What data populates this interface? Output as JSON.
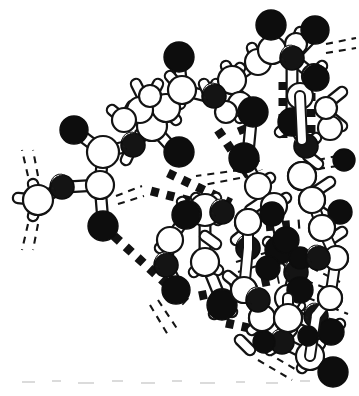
{
  "figure": {
    "background_color": "#ffffff",
    "ink_color": "#111111",
    "width_px": 359,
    "height_px": 396,
    "caption": "",
    "axis_labels": [],
    "annotations": []
  },
  "legend": {
    "atom_types": [
      {
        "name": "carbon",
        "label": "C",
        "render": "white-sphere",
        "fill": "#ffffff",
        "stroke": "#111111"
      },
      {
        "name": "nitrogen",
        "label": "N",
        "render": "stippled-sphere",
        "fill": "#1a1a1a",
        "highlight": "#e8e8e8"
      },
      {
        "name": "oxygen",
        "label": "O",
        "render": "black-sphere",
        "fill": "#0d0d0d",
        "stroke": "#0d0d0d"
      }
    ],
    "bond_types": [
      {
        "name": "covalent-bond",
        "render": "solid-cylinder",
        "color": "#ffffff",
        "outline": "#111111"
      },
      {
        "name": "hydrogen-bond",
        "render": "thick-square-dashed-line",
        "color": "#111111"
      },
      {
        "name": "truncated-bond",
        "render": "thin-dashed-line",
        "color": "#111111"
      }
    ]
  },
  "chart_data": {
    "type": "diagram",
    "atoms": [
      {
        "id": "o1",
        "element": "O",
        "x": 74,
        "y": 130,
        "r": 13
      },
      {
        "id": "c1",
        "element": "C",
        "x": 103,
        "y": 152,
        "r": 15
      },
      {
        "id": "n1",
        "element": "N",
        "x": 133,
        "y": 145,
        "r": 13
      },
      {
        "id": "c2",
        "element": "C",
        "x": 100,
        "y": 185,
        "r": 13
      },
      {
        "id": "n2",
        "element": "N",
        "x": 62,
        "y": 187,
        "r": 12
      },
      {
        "id": "c3",
        "element": "C",
        "x": 38,
        "y": 200,
        "r": 14
      },
      {
        "id": "o2",
        "element": "O",
        "x": 103,
        "y": 226,
        "r": 14
      },
      {
        "id": "c4",
        "element": "C",
        "x": 148,
        "y": 125,
        "r": 14
      },
      {
        "id": "c5",
        "element": "C",
        "x": 162,
        "y": 105,
        "r": 13
      },
      {
        "id": "c6",
        "element": "C",
        "x": 179,
        "y": 88,
        "r": 12
      },
      {
        "id": "o3",
        "element": "O",
        "x": 179,
        "y": 57,
        "r": 14
      },
      {
        "id": "c7",
        "element": "C",
        "x": 190,
        "y": 82,
        "r": 14
      },
      {
        "id": "n3",
        "element": "N",
        "x": 214,
        "y": 96,
        "r": 12
      },
      {
        "id": "o4",
        "element": "O",
        "x": 179,
        "y": 152,
        "r": 14
      },
      {
        "id": "c8",
        "element": "C",
        "x": 205,
        "y": 210,
        "r": 15
      },
      {
        "id": "n4",
        "element": "N",
        "x": 222,
        "y": 212,
        "r": 12
      },
      {
        "id": "o5",
        "element": "O",
        "x": 186,
        "y": 215,
        "r": 13
      },
      {
        "id": "o6",
        "element": "O",
        "x": 176,
        "y": 290,
        "r": 13
      },
      {
        "id": "n5",
        "element": "N",
        "x": 166,
        "y": 265,
        "r": 12
      },
      {
        "id": "c9",
        "element": "C",
        "x": 205,
        "y": 262,
        "r": 14
      },
      {
        "id": "o7",
        "element": "O",
        "x": 222,
        "y": 305,
        "r": 14
      },
      {
        "id": "o8",
        "element": "O",
        "x": 253,
        "y": 112,
        "r": 14
      },
      {
        "id": "o9",
        "element": "O",
        "x": 244,
        "y": 158,
        "r": 14
      },
      {
        "id": "o10",
        "element": "O",
        "x": 271,
        "y": 25,
        "r": 14
      },
      {
        "id": "c10",
        "element": "C",
        "x": 272,
        "y": 50,
        "r": 14
      },
      {
        "id": "n6",
        "element": "N",
        "x": 292,
        "y": 58,
        "r": 12
      },
      {
        "id": "o11",
        "element": "O",
        "x": 315,
        "y": 30,
        "r": 13
      },
      {
        "id": "o12",
        "element": "O",
        "x": 316,
        "y": 78,
        "r": 12
      },
      {
        "id": "o13",
        "element": "O",
        "x": 292,
        "y": 122,
        "r": 13
      },
      {
        "id": "n7",
        "element": "N",
        "x": 308,
        "y": 148,
        "r": 11
      },
      {
        "id": "o14",
        "element": "O",
        "x": 279,
        "y": 250,
        "r": 13
      },
      {
        "id": "n8",
        "element": "N",
        "x": 296,
        "y": 272,
        "r": 11
      },
      {
        "id": "o15",
        "element": "O",
        "x": 286,
        "y": 300,
        "r": 13
      },
      {
        "id": "n9",
        "element": "N",
        "x": 281,
        "y": 345,
        "r": 12
      },
      {
        "id": "o16",
        "element": "O",
        "x": 333,
        "y": 372,
        "r": 14
      },
      {
        "id": "o17",
        "element": "O",
        "x": 331,
        "y": 332,
        "r": 12
      }
    ],
    "hydrogen_bonds": [
      {
        "from": [
          113,
          235
        ],
        "to": [
          185,
          300
        ],
        "style": "square-dashed"
      },
      {
        "from": [
          150,
          190
        ],
        "to": [
          222,
          208
        ],
        "style": "square-dashed"
      },
      {
        "from": [
          166,
          172
        ],
        "to": [
          230,
          202
        ],
        "style": "square-dashed"
      },
      {
        "from": [
          216,
          128
        ],
        "to": [
          248,
          175
        ],
        "style": "square-dashed"
      },
      {
        "from": [
          239,
          125
        ],
        "to": [
          257,
          170
        ],
        "style": "square-dashed"
      },
      {
        "from": [
          283,
          80
        ],
        "to": [
          283,
          140
        ],
        "style": "square-dashed"
      },
      {
        "from": [
          311,
          76
        ],
        "to": [
          311,
          136
        ],
        "style": "square-dashed"
      },
      {
        "from": [
          198,
          295
        ],
        "to": [
          278,
          278
        ],
        "style": "square-dashed"
      },
      {
        "from": [
          225,
          322
        ],
        "to": [
          262,
          330
        ],
        "style": "square-dashed"
      }
    ],
    "truncated_bonds": [
      {
        "at": [
          30,
          178
        ],
        "angle": -78
      },
      {
        "at": [
          30,
          222
        ],
        "angle": 78
      },
      {
        "at": [
          116,
          196
        ],
        "angle": 32
      },
      {
        "at": [
          160,
          300
        ],
        "angle": 58
      },
      {
        "at": [
          240,
          170
        ],
        "angle": 180
      },
      {
        "at": [
          330,
          48
        ],
        "angle": 8
      },
      {
        "at": [
          330,
          163
        ],
        "angle": 5
      },
      {
        "at": [
          300,
          262
        ],
        "angle": 28
      },
      {
        "at": [
          305,
          290
        ],
        "angle": 22
      },
      {
        "at": [
          268,
          355
        ],
        "angle": 35
      }
    ]
  }
}
